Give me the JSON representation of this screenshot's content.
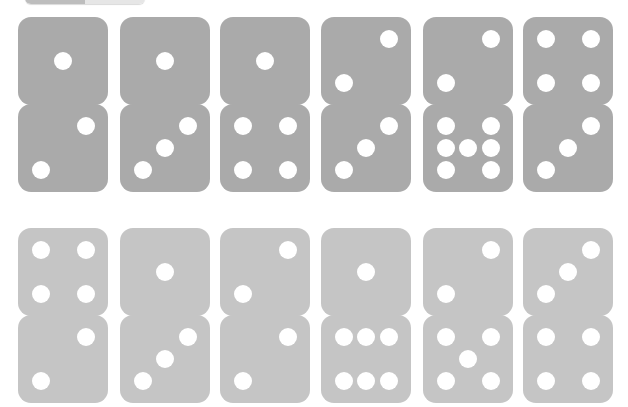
{
  "top_control": {
    "segments": [
      {
        "label": "",
        "active": true
      },
      {
        "label": "",
        "active": false
      }
    ]
  },
  "colors": {
    "row1_die": "#aaaaaa",
    "row2_die": "#c5c5c5",
    "pip": "#ffffff",
    "background": "#ffffff"
  },
  "rows": [
    {
      "top": 17,
      "color": "#aaaaaa",
      "pairs": [
        {
          "left": 18,
          "top_face": 1,
          "bottom_face": 2
        },
        {
          "left": 120,
          "top_face": 1,
          "bottom_face": 3
        },
        {
          "left": 220,
          "top_face": 1,
          "bottom_face": 4
        },
        {
          "left": 321,
          "top_face": 2,
          "bottom_face": 3
        },
        {
          "left": 423,
          "top_face": 2,
          "bottom_face": 7
        },
        {
          "left": 523,
          "top_face": 4,
          "bottom_face": 3
        }
      ]
    },
    {
      "top": 228,
      "color": "#c5c5c5",
      "pairs": [
        {
          "left": 18,
          "top_face": 4,
          "bottom_face": 2
        },
        {
          "left": 120,
          "top_face": 1,
          "bottom_face": 3
        },
        {
          "left": 220,
          "top_face": 2,
          "bottom_face": 2
        },
        {
          "left": 321,
          "top_face": 1,
          "bottom_face": 6
        },
        {
          "left": 423,
          "top_face": 2,
          "bottom_face": 5
        },
        {
          "left": 523,
          "top_face": 3,
          "bottom_face": 4
        }
      ]
    }
  ],
  "pip_layouts": {
    "1": [
      [
        50,
        50
      ]
    ],
    "2": [
      [
        75,
        25
      ],
      [
        25,
        75
      ]
    ],
    "3": [
      [
        75,
        25
      ],
      [
        50,
        50
      ],
      [
        25,
        75
      ]
    ],
    "4": [
      [
        25,
        25
      ],
      [
        75,
        25
      ],
      [
        25,
        75
      ],
      [
        75,
        75
      ]
    ],
    "5": [
      [
        25,
        25
      ],
      [
        75,
        25
      ],
      [
        50,
        50
      ],
      [
        25,
        75
      ],
      [
        75,
        75
      ]
    ],
    "6": [
      [
        25,
        25
      ],
      [
        50,
        25
      ],
      [
        75,
        25
      ],
      [
        25,
        75
      ],
      [
        50,
        75
      ],
      [
        75,
        75
      ]
    ],
    "7": [
      [
        25,
        25
      ],
      [
        75,
        25
      ],
      [
        25,
        50
      ],
      [
        50,
        50
      ],
      [
        75,
        50
      ],
      [
        25,
        75
      ],
      [
        75,
        75
      ]
    ]
  }
}
